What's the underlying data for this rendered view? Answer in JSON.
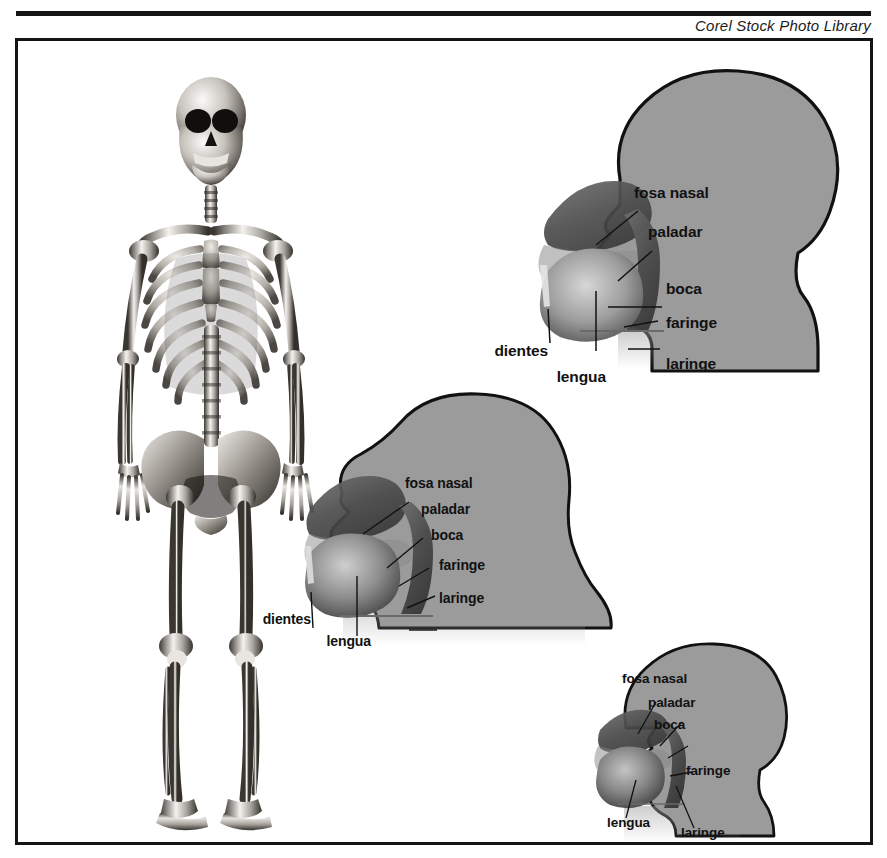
{
  "credit": "Corel Stock Photo Library",
  "plate": {
    "title": "Corel Stock Photo Library",
    "frame_color": "#141414",
    "background_color": "#ffffff"
  },
  "colors": {
    "head_fill": "#9b9b9b",
    "head_outline": "#111111",
    "cavity_dark": "#4a4a4a",
    "cavity_mid": "#6d6d6d",
    "tongue_light": "#c9c9c9",
    "label_text": "#111111",
    "bone_light": "#f2f0ee",
    "bone_mid": "#8e8b88",
    "bone_dark": "#2a2826"
  },
  "figures": {
    "skeleton": {
      "name": "human-skeleton-anterior-view",
      "caption": ""
    },
    "head_large": {
      "name": "vocal-tract-adult-sagittal",
      "labels": [
        {
          "id": "fosa-nasal",
          "text": "fosa nasal"
        },
        {
          "id": "paladar",
          "text": "paladar"
        },
        {
          "id": "boca",
          "text": "boca"
        },
        {
          "id": "faringe",
          "text": "faringe"
        },
        {
          "id": "laringe",
          "text": "laringe"
        },
        {
          "id": "dientes",
          "text": "dientes"
        },
        {
          "id": "lengua",
          "text": "lengua"
        }
      ]
    },
    "head_medium": {
      "name": "vocal-tract-child-sagittal",
      "labels": [
        {
          "id": "fosa-nasal",
          "text": "fosa nasal"
        },
        {
          "id": "paladar",
          "text": "paladar"
        },
        {
          "id": "boca",
          "text": "boca"
        },
        {
          "id": "faringe",
          "text": "faringe"
        },
        {
          "id": "laringe",
          "text": "laringe"
        },
        {
          "id": "dientes",
          "text": "dientes"
        },
        {
          "id": "lengua",
          "text": "lengua"
        }
      ]
    },
    "head_small": {
      "name": "vocal-tract-infant-sagittal",
      "labels": [
        {
          "id": "fosa-nasal",
          "text": "fosa nasal"
        },
        {
          "id": "paladar",
          "text": "paladar"
        },
        {
          "id": "boca",
          "text": "boca"
        },
        {
          "id": "faringe",
          "text": "faringe"
        },
        {
          "id": "lengua",
          "text": "lengua"
        },
        {
          "id": "laringe",
          "text": "laringe"
        }
      ]
    }
  }
}
